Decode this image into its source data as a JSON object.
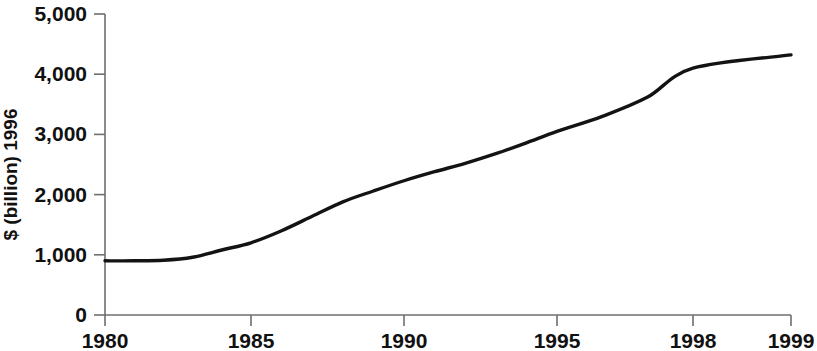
{
  "chart_data": {
    "type": "line",
    "title": "",
    "xlabel": "",
    "ylabel": "$ (billion) 1996",
    "x_tick_labels": [
      "1980",
      "1985",
      "1990",
      "1995",
      "1998",
      "1999"
    ],
    "x_tick_values": [
      1980,
      1985,
      1990,
      1995,
      1998,
      1999
    ],
    "y_tick_labels": [
      "0",
      "1,000",
      "2,000",
      "3,000",
      "4,000",
      "5,000"
    ],
    "y_tick_values": [
      0,
      1000,
      2000,
      3000,
      4000,
      5000
    ],
    "ylim": [
      0,
      5000
    ],
    "xlim": [
      1980,
      1999
    ],
    "grid": false,
    "legend": false,
    "axis_note": "x-axis spacing is non-linear: 1980-1995 evenly spaced in 5-year steps, then 1998 and 1999 individually ticked",
    "series": [
      {
        "name": "$ (billion) 1996",
        "x": [
          1980,
          1981,
          1982,
          1983,
          1984,
          1985,
          1986,
          1987,
          1988,
          1989,
          1990,
          1991,
          1992,
          1993,
          1994,
          1995,
          1996,
          1997,
          1998,
          1999
        ],
        "values": [
          900,
          900,
          910,
          960,
          1080,
          1200,
          1400,
          1640,
          1880,
          2060,
          2230,
          2380,
          2520,
          2680,
          2860,
          3050,
          3300,
          3620,
          4100,
          4320
        ]
      }
    ]
  },
  "colors": {
    "curve": "#131313",
    "axis": "#6f6f6f",
    "text": "#111111",
    "background": "#ffffff"
  }
}
